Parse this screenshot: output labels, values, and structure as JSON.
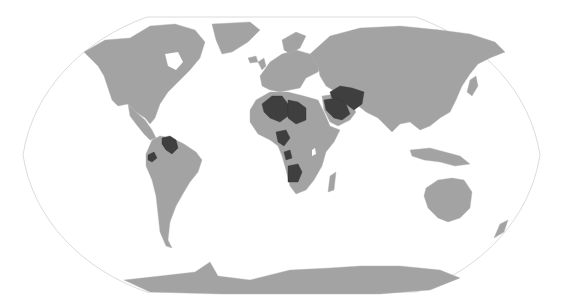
{
  "map": {
    "projection": "robinson",
    "colors": {
      "background": "#ffffff",
      "land": "#a3a3a3",
      "highlighted": "#3f3f3f",
      "frame": "#dcdcdc"
    },
    "legend": null,
    "highlighted_countries": [
      "Venezuela",
      "Ecuador",
      "Algeria",
      "Libya",
      "Nigeria",
      "Gabon",
      "Equatorial Guinea",
      "Republic of the Congo",
      "Angola",
      "Saudi Arabia",
      "Iraq",
      "Iran",
      "Kuwait",
      "United Arab Emirates",
      "Qatar"
    ],
    "regions": [
      "north-america",
      "greenland",
      "south-america",
      "europe",
      "africa",
      "asia",
      "arabia",
      "madagascar",
      "indonesia",
      "australia",
      "new-zealand",
      "antarctica",
      "japan",
      "uk",
      "iceland"
    ]
  }
}
